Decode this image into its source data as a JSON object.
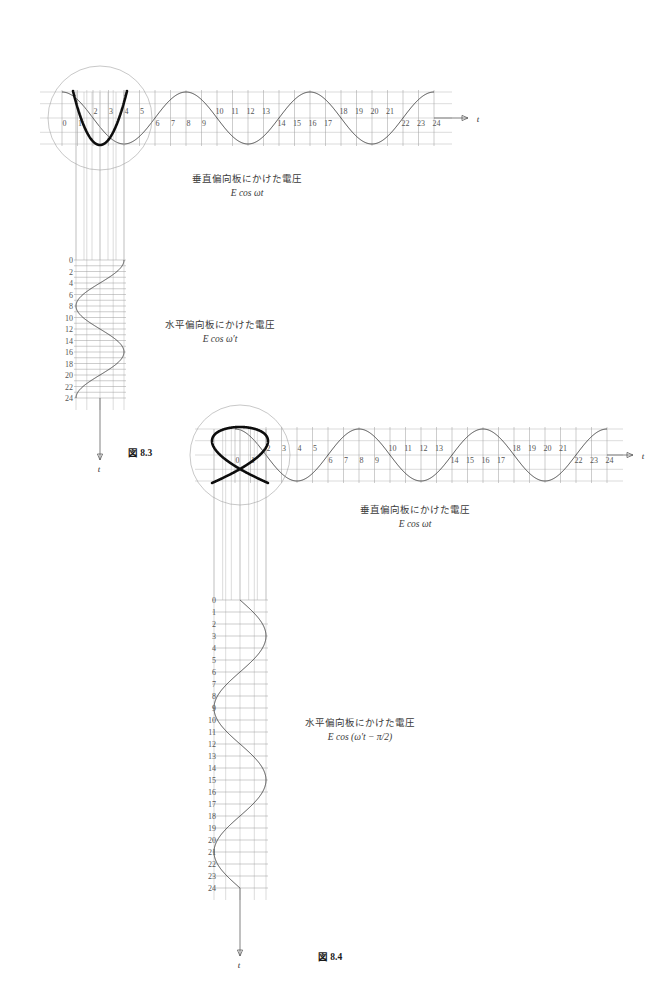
{
  "page": {
    "background": "#ffffff",
    "accent_curve_color": "#0d0d0d",
    "grid_color": "#9a9a9a",
    "wave_color": "#3a3a3a"
  },
  "figures": [
    {
      "id": "fig-8-3",
      "caption": "図 8.3",
      "lissajous": {
        "name": "lissajous-n-shape",
        "ratio_label": "1:2",
        "description": "N/M shaped Lissajous curve"
      },
      "horizontal": {
        "axis_label": "t",
        "caption_jp": "垂直偏向板にかけた電圧",
        "caption_eq": "E cos ωt",
        "tick_labels": [
          "0",
          "1",
          "2",
          "3",
          "4",
          "5",
          "6",
          "7",
          "8",
          "9",
          "10",
          "11",
          "12",
          "13",
          "14",
          "15",
          "16",
          "17",
          "18",
          "19",
          "20",
          "21",
          "22",
          "23",
          "24"
        ],
        "cycles": 3,
        "n_ticks": 25
      },
      "vertical": {
        "axis_label": "t",
        "caption_jp": "水平偏向板にかけた電圧",
        "caption_eq": "E cos ω′t",
        "tick_labels": [
          "0",
          "2",
          "4",
          "6",
          "8",
          "10",
          "12",
          "14",
          "16",
          "18",
          "20",
          "22",
          "24"
        ],
        "cycles": 1.5,
        "n_ticks": 25
      }
    },
    {
      "id": "fig-8-4",
      "caption": "図 8.4",
      "lissajous": {
        "name": "lissajous-crossed-shape",
        "ratio_label": "2:3",
        "description": "Crossed mesh Lissajous curve"
      },
      "horizontal": {
        "axis_label": "t",
        "caption_jp": "垂直偏向板にかけた電圧",
        "caption_eq": "E cos ωt",
        "tick_labels": [
          "0",
          "1",
          "2",
          "3",
          "4",
          "5",
          "6",
          "7",
          "8",
          "9",
          "10",
          "11",
          "12",
          "13",
          "14",
          "15",
          "16",
          "17",
          "18",
          "19",
          "20",
          "21",
          "22",
          "23",
          "24"
        ],
        "cycles": 3,
        "n_ticks": 25
      },
      "vertical": {
        "axis_label": "t",
        "caption_jp": "水平偏向板にかけた電圧",
        "caption_eq": "E cos (ω′t − π/2)",
        "tick_labels": [
          "0",
          "1",
          "2",
          "3",
          "4",
          "5",
          "6",
          "7",
          "8",
          "9",
          "10",
          "11",
          "12",
          "13",
          "14",
          "15",
          "16",
          "17",
          "18",
          "19",
          "20",
          "21",
          "22",
          "23",
          "24"
        ],
        "cycles": 2,
        "n_ticks": 25
      }
    }
  ],
  "chart_data": {
    "type": "line",
    "xlabel": "t",
    "ylabel": "t",
    "grid": true,
    "legend_position": "none",
    "series": [
      {
        "name": "fig8.3-vertical-plate-voltage",
        "formula": "E cos(ωt)",
        "x": [
          0,
          1,
          2,
          3,
          4,
          5,
          6,
          7,
          8,
          9,
          10,
          11,
          12,
          13,
          14,
          15,
          16,
          17,
          18,
          19,
          20,
          21,
          22,
          23,
          24
        ],
        "values": [
          1.0,
          0.707,
          0.0,
          -0.707,
          -1.0,
          -0.707,
          0.0,
          0.707,
          1.0,
          0.707,
          0.0,
          -0.707,
          -1.0,
          -0.707,
          0.0,
          0.707,
          1.0,
          0.707,
          0.0,
          -0.707,
          -1.0,
          -0.707,
          0.0,
          0.707,
          1.0
        ]
      },
      {
        "name": "fig8.3-horizontal-plate-voltage",
        "formula": "E cos(ω′t)",
        "x": [
          0,
          2,
          4,
          6,
          8,
          10,
          12,
          14,
          16,
          18,
          20,
          22,
          24
        ],
        "values": [
          1.0,
          0.866,
          0.5,
          0.0,
          -0.5,
          -0.866,
          -1.0,
          -0.866,
          -0.5,
          0.0,
          0.5,
          0.866,
          1.0
        ]
      },
      {
        "name": "fig8.4-vertical-plate-voltage",
        "formula": "E cos(ωt)",
        "x": [
          0,
          1,
          2,
          3,
          4,
          5,
          6,
          7,
          8,
          9,
          10,
          11,
          12,
          13,
          14,
          15,
          16,
          17,
          18,
          19,
          20,
          21,
          22,
          23,
          24
        ],
        "values": [
          1.0,
          0.707,
          0.0,
          -0.707,
          -1.0,
          -0.707,
          0.0,
          0.707,
          1.0,
          0.707,
          0.0,
          -0.707,
          -1.0,
          -0.707,
          0.0,
          0.707,
          1.0,
          0.707,
          0.0,
          -0.707,
          -1.0,
          -0.707,
          0.0,
          0.707,
          1.0
        ]
      },
      {
        "name": "fig8.4-horizontal-plate-voltage",
        "formula": "E cos(ω′t − π/2)",
        "x": [
          0,
          2,
          4,
          6,
          8,
          10,
          12,
          14,
          16,
          18,
          20,
          22,
          24
        ],
        "values": [
          0.0,
          0.5,
          0.866,
          1.0,
          0.866,
          0.5,
          0.0,
          -0.5,
          -0.866,
          -1.0,
          -0.866,
          -0.5,
          0.0
        ]
      }
    ],
    "annotations": [
      {
        "text": "垂直偏向板にかけた電圧",
        "meaning": "voltage applied to vertical deflection plates"
      },
      {
        "text": "水平偏向板にかけた電圧",
        "meaning": "voltage applied to horizontal deflection plates"
      },
      {
        "text": "図 8.3"
      },
      {
        "text": "図 8.4"
      }
    ]
  }
}
